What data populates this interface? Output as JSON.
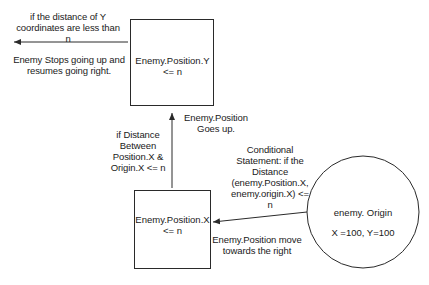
{
  "diagram": {
    "nodes": {
      "position_y_box": {
        "line1": "Enemy.Position.Y",
        "line2": "<= n"
      },
      "position_x_box": {
        "line1": "Enemy.Position.X",
        "line2": "<= n"
      },
      "origin_circle": {
        "line1": "enemy. Origin",
        "line2": "X =100, Y=100"
      }
    },
    "labels": {
      "exit_condition": {
        "line1": "if the distance of Y",
        "line2": "coordinates are less than",
        "line3": "n"
      },
      "exit_action": {
        "line1": "Enemy Stops going up and",
        "line2": "resumes going right."
      },
      "up_action": {
        "line1": "Enemy.Position",
        "line2": "Goes up."
      },
      "up_condition": {
        "line1": "if Distance",
        "line2": "Between",
        "line3": "Position.X &",
        "line4": "Origin.X <= n"
      },
      "origin_condition": {
        "line1": "Conditional",
        "line2": "Statement: if  the",
        "line3": "Distance",
        "line4": "(enemy.Position.X,",
        "line5": "enemy.origin.X) <=",
        "line6": "n"
      },
      "right_action": {
        "line1": "Enemy.Position move",
        "line2": "towards the right"
      }
    },
    "colors": {
      "stroke": "#2a2a2a",
      "text": "#1a1a1a",
      "background": "#ffffff"
    }
  }
}
